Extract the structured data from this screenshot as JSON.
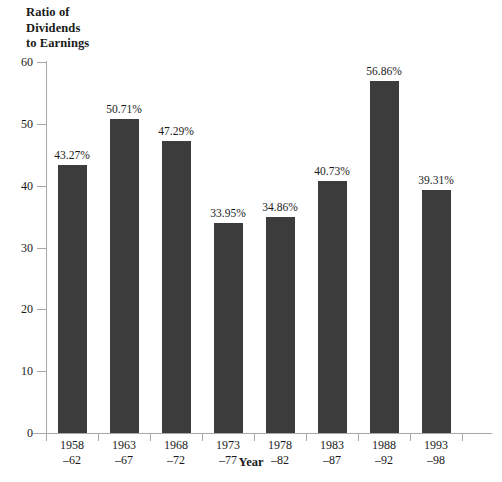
{
  "chart_data": {
    "type": "bar",
    "title": "",
    "ylabel": "Ratio of\nDividends\nto Earnings",
    "ylabel_lines": [
      "Ratio of",
      "Dividends",
      "to Earnings"
    ],
    "xlabel": "Year",
    "ylim": [
      0,
      60
    ],
    "yticks": [
      0,
      10,
      20,
      30,
      40,
      50,
      60
    ],
    "ytick_labels": [
      "0",
      "10",
      "20",
      "30",
      "40",
      "50",
      "60"
    ],
    "grid": false,
    "legend": null,
    "bar_color": "#3c3c3c",
    "axis_color": "#a8a8a8",
    "categories": [
      "1958–62",
      "1963–67",
      "1968–72",
      "1973–77",
      "1978–82",
      "1983–87",
      "1988–92",
      "1993–98"
    ],
    "category_lines": [
      {
        "line1": "1958",
        "line2": "–62"
      },
      {
        "line1": "1963",
        "line2": "–67"
      },
      {
        "line1": "1968",
        "line2": "–72"
      },
      {
        "line1": "1973",
        "line2": "–77"
      },
      {
        "line1": "1978",
        "line2": "–82"
      },
      {
        "line1": "1983",
        "line2": "–87"
      },
      {
        "line1": "1988",
        "line2": "–92"
      },
      {
        "line1": "1993",
        "line2": "–98"
      }
    ],
    "values": [
      43.27,
      50.71,
      47.29,
      33.95,
      34.86,
      40.73,
      56.86,
      39.31
    ],
    "value_labels": [
      "43.27%",
      "50.71%",
      "47.29%",
      "33.95%",
      "34.86%",
      "40.73%",
      "56.86%",
      "39.31%"
    ]
  }
}
